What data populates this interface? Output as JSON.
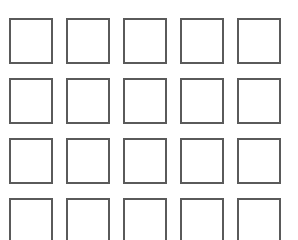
{
  "grid": {
    "rows": 4,
    "columns": 5,
    "border_color": "#5a5a5a",
    "background": "#ffffff",
    "cells": [
      {
        "row": 1,
        "col": 1
      },
      {
        "row": 1,
        "col": 2
      },
      {
        "row": 1,
        "col": 3
      },
      {
        "row": 1,
        "col": 4
      },
      {
        "row": 1,
        "col": 5
      },
      {
        "row": 2,
        "col": 1
      },
      {
        "row": 2,
        "col": 2
      },
      {
        "row": 2,
        "col": 3
      },
      {
        "row": 2,
        "col": 4
      },
      {
        "row": 2,
        "col": 5
      },
      {
        "row": 3,
        "col": 1
      },
      {
        "row": 3,
        "col": 2
      },
      {
        "row": 3,
        "col": 3
      },
      {
        "row": 3,
        "col": 4
      },
      {
        "row": 3,
        "col": 5
      },
      {
        "row": 4,
        "col": 1
      },
      {
        "row": 4,
        "col": 2
      },
      {
        "row": 4,
        "col": 3
      },
      {
        "row": 4,
        "col": 4
      },
      {
        "row": 4,
        "col": 5
      }
    ]
  }
}
